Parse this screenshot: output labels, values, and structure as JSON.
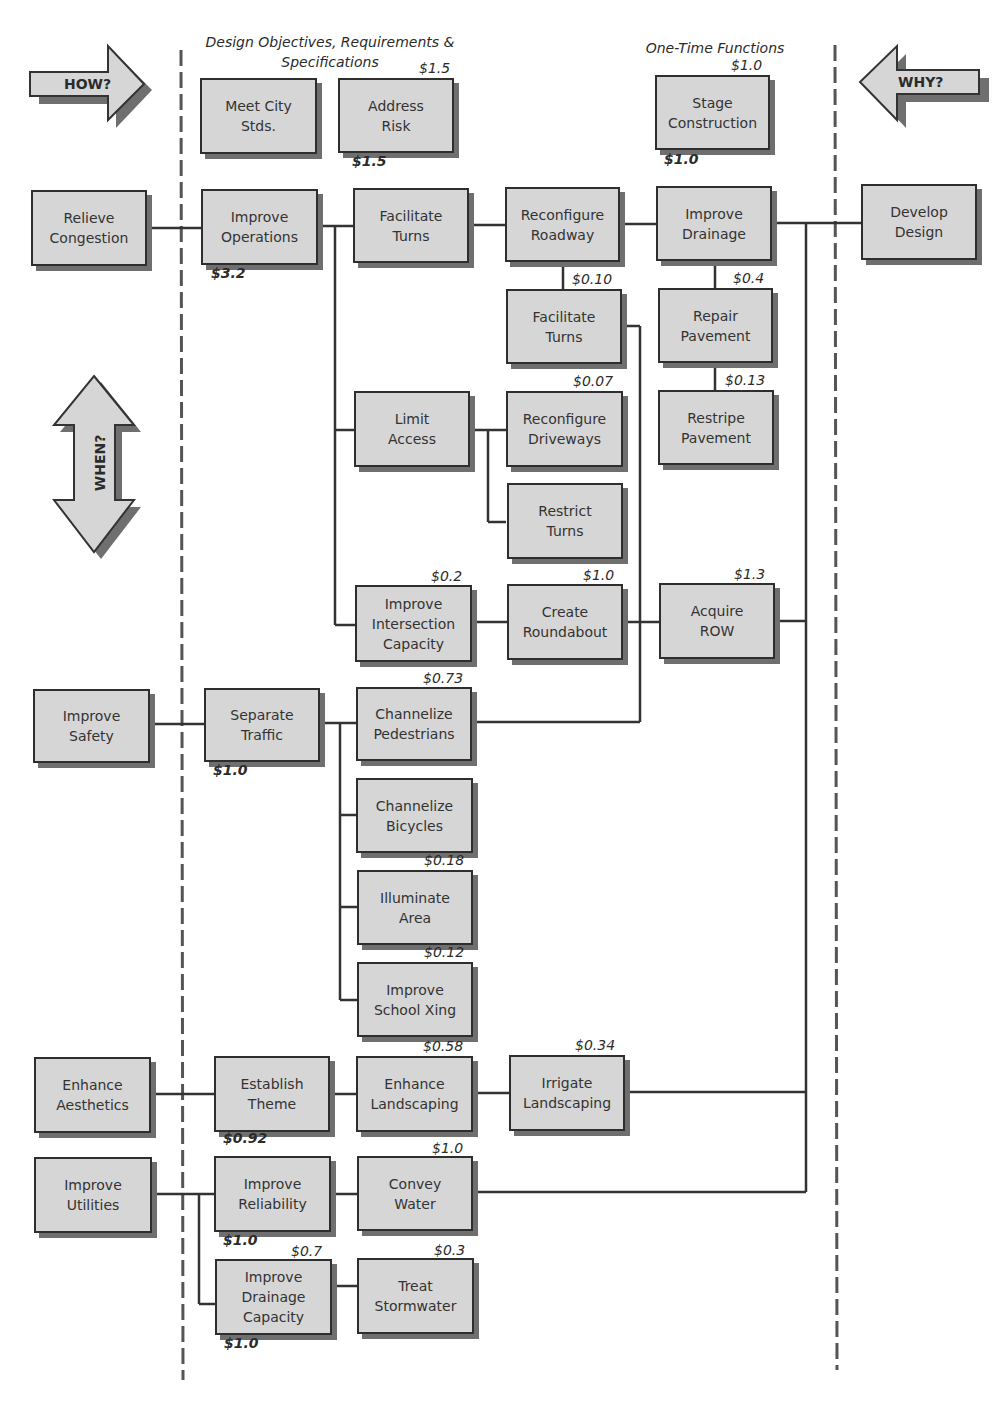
{
  "headers": {
    "design_objectives": "Design Objectives, Requirements &\nSpecifications",
    "one_time": "One-Time Functions"
  },
  "arrows": {
    "how": "HOW?",
    "why": "WHY?",
    "when": "WHEN?"
  },
  "boxes": {
    "meet_city": "Meet City\nStds.",
    "address_risk": "Address\nRisk",
    "stage_construction": "Stage\nConstruction",
    "relieve_congestion": "Relieve\nCongestion",
    "improve_operations": "Improve\nOperations",
    "facilitate_turns_1": "Facilitate\nTurns",
    "reconfigure_roadway": "Reconfigure\nRoadway",
    "improve_drainage": "Improve\nDrainage",
    "develop_design": "Develop\nDesign",
    "facilitate_turns_2": "Facilitate\nTurns",
    "repair_pavement": "Repair\nPavement",
    "limit_access": "Limit\nAccess",
    "reconfigure_driveways": "Reconfigure\nDriveways",
    "restripe_pavement": "Restripe\nPavement",
    "restrict_turns": "Restrict\nTurns",
    "improve_intersection": "Improve\nIntersection\nCapacity",
    "create_roundabout": "Create\nRoundabout",
    "acquire_row": "Acquire\nROW",
    "improve_safety": "Improve\nSafety",
    "separate_traffic": "Separate\nTraffic",
    "channelize_pedestrians": "Channelize\nPedestrians",
    "channelize_bicycles": "Channelize\nBicycles",
    "illuminate_area": "Illuminate\nArea",
    "improve_school_xing": "Improve\nSchool Xing",
    "enhance_aesthetics": "Enhance\nAesthetics",
    "establish_theme": "Establish\nTheme",
    "enhance_landscaping": "Enhance\nLandscaping",
    "irrigate_landscaping": "Irrigate\nLandscaping",
    "improve_utilities": "Improve\nUtilities",
    "improve_reliability": "Improve\nReliability",
    "convey_water": "Convey\nWater",
    "improve_drainage_capacity": "Improve\nDrainage\nCapacity",
    "treat_stormwater": "Treat\nStormwater"
  },
  "costs": {
    "address_risk_top": "$1.5",
    "address_risk_bottom": "$1.5",
    "stage_top": "$1.0",
    "stage_bottom": "$1.0",
    "improve_operations": "$3.2",
    "facilitate_turns_2": "$0.10",
    "repair_pavement": "$0.4",
    "reconfigure_driveways": "$0.07",
    "restripe_pavement": "$0.13",
    "improve_intersection": "$0.2",
    "create_roundabout": "$1.0",
    "acquire_row": "$1.3",
    "channelize_pedestrians": "$0.73",
    "separate_traffic": "$1.0",
    "illuminate_area": "$0.18",
    "improve_school_xing": "$0.12",
    "enhance_landscaping": "$0.58",
    "irrigate_landscaping": "$0.34",
    "establish_theme": "$0.92",
    "convey_water": "$1.0",
    "improve_reliability": "$1.0",
    "improve_drainage_capacity_top": "$0.7",
    "treat_stormwater": "$0.3",
    "improve_drainage_capacity_bottom": "$1.0"
  }
}
